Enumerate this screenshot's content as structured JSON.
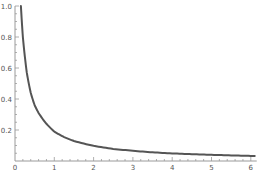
{
  "chart_data": {
    "type": "line",
    "title": "",
    "xlabel": "",
    "ylabel": "",
    "xlim": [
      0,
      6.1
    ],
    "ylim": [
      0,
      1.0
    ],
    "grid": false,
    "legend": null,
    "x_ticks": [
      0,
      1,
      2,
      3,
      4,
      5,
      6
    ],
    "x_tick_labels": [
      "0",
      "1",
      "2",
      "3",
      "4",
      "5",
      "6"
    ],
    "y_ticks": [
      0.2,
      0.4,
      0.6,
      0.8,
      1.0
    ],
    "y_tick_labels": [
      "0.2",
      "0.4",
      "0.6",
      "0.8",
      "1.0"
    ],
    "series": [
      {
        "name": "curve",
        "color": "#555555",
        "x": [
          0.15,
          0.2,
          0.3,
          0.4,
          0.5,
          0.6,
          0.8,
          1.0,
          1.25,
          1.5,
          2.0,
          2.5,
          3.0,
          3.5,
          4.0,
          4.5,
          5.0,
          5.5,
          6.0,
          6.1
        ],
        "y": [
          1.0,
          0.8,
          0.57,
          0.44,
          0.36,
          0.31,
          0.24,
          0.19,
          0.154,
          0.129,
          0.098,
          0.078,
          0.066,
          0.056,
          0.049,
          0.044,
          0.04,
          0.036,
          0.033,
          0.032
        ]
      }
    ]
  },
  "colors": {
    "axis": "#9a9a9a",
    "curve": "#555555",
    "label": "#555555"
  }
}
